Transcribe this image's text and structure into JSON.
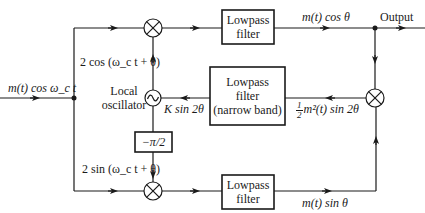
{
  "diagram": {
    "type": "block-diagram",
    "input_label": "m(t) cos ω_c t",
    "output_label": "Output",
    "blocks": {
      "top_lowpass": {
        "line1": "Lowpass",
        "line2": "filter"
      },
      "bottom_lowpass": {
        "line1": "Lowpass",
        "line2": "filter"
      },
      "narrow_lowpass": {
        "line1": "Lowpass",
        "line2": "filter",
        "line3": "(narrow band)"
      },
      "phase_shift": "−π/2",
      "oscillator_label_line1": "Local",
      "oscillator_label_line2": "oscillator",
      "oscillator_symbol": "~",
      "multiplier_symbol": "⊗"
    },
    "signals": {
      "top_carrier": "2 cos (ω_c t + θ)",
      "bottom_carrier": "2 sin (ω_c t + θ)",
      "top_output": "m(t) cos θ",
      "bottom_output": "m(t) sin θ",
      "control": "K sin 2θ",
      "product_frac_num": "1",
      "product_frac_den": "2",
      "product_rest": "m²(t) sin 2θ"
    }
  },
  "colors": {
    "line": "#1a1a1a",
    "background": "#ffffff"
  }
}
